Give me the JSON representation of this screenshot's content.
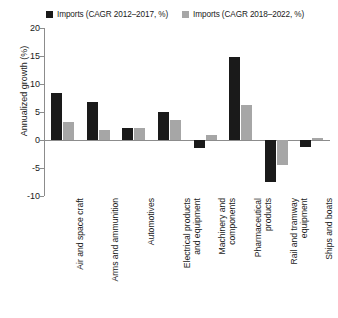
{
  "chart_data": {
    "type": "bar",
    "title": "",
    "subtitle": "",
    "xlabel": "",
    "ylabel": "Annualized growth (%)",
    "ylim": [
      -10,
      20
    ],
    "yticks": [
      20,
      15,
      10,
      5,
      0,
      -5,
      -10
    ],
    "ytick_labels": [
      "20",
      "15",
      "10",
      "5",
      "0",
      "-5",
      "-10"
    ],
    "grid": false,
    "legend_position": "top",
    "orientation": "vertical",
    "zero_line": true,
    "categories": [
      "Air and space craft",
      "Arms and ammunition",
      "Automotives",
      "Electrical products\nand equipment",
      "Machinery and\ncomponents",
      "Pharmaceutical\nproducts",
      "Rail and tramway\nequipment",
      "Ships and boats"
    ],
    "series": [
      {
        "name": "Imports (CAGR 2012–2017, %)",
        "color": "#1a1a1a",
        "values": [
          8.4,
          6.8,
          2.1,
          5.0,
          -1.5,
          14.8,
          -7.5,
          -1.3
        ]
      },
      {
        "name": "Imports (CAGR 2018–2022, %)",
        "color": "#a6a6a6",
        "values": [
          3.2,
          1.7,
          2.2,
          3.6,
          0.9,
          6.3,
          -4.5,
          0.4
        ]
      }
    ]
  },
  "legend": {
    "entries": [
      {
        "label": "Imports (CAGR 2012–2017, %)",
        "color": "#1a1a1a"
      },
      {
        "label": "Imports (CAGR 2018–2022, %)",
        "color": "#a6a6a6"
      }
    ]
  },
  "colors": {
    "series_1": "#1a1a1a",
    "series_2": "#a6a6a6",
    "axis": "#8c8c8c",
    "text": "#1a1a1a",
    "background": "#ffffff"
  }
}
